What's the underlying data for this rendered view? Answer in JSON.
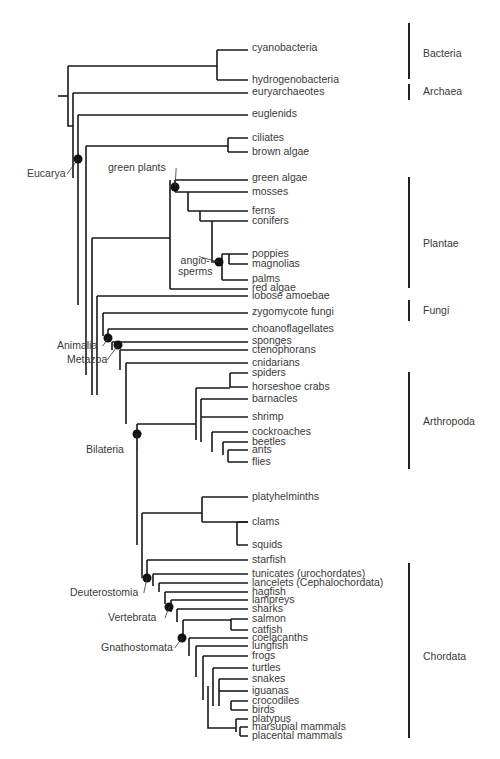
{
  "tips": [
    {
      "id": "cyanobacteria",
      "label": "cyanobacteria",
      "y": 48
    },
    {
      "id": "hydrogenobacteria",
      "label": "hydrogenobacteria",
      "y": 80
    },
    {
      "id": "euryarchaeotes",
      "label": "euryarchaeotes",
      "y": 92
    },
    {
      "id": "euglenids",
      "label": "euglenids",
      "y": 114
    },
    {
      "id": "ciliates",
      "label": "ciliates",
      "y": 138
    },
    {
      "id": "brown-algae",
      "label": "brown algae",
      "y": 152
    },
    {
      "id": "green-algae",
      "label": "green algae",
      "y": 178
    },
    {
      "id": "mosses",
      "label": "mosses",
      "y": 192
    },
    {
      "id": "ferns",
      "label": "ferns",
      "y": 211
    },
    {
      "id": "conifers",
      "label": "conifers",
      "y": 221
    },
    {
      "id": "poppies",
      "label": "poppies",
      "y": 254
    },
    {
      "id": "magnolias",
      "label": "magnolias",
      "y": 264
    },
    {
      "id": "palms",
      "label": "palms",
      "y": 279
    },
    {
      "id": "red-algae",
      "label": "red algae",
      "y": 288
    },
    {
      "id": "lobose-amoebae",
      "label": "lobose amoebae",
      "y": 296
    },
    {
      "id": "zygomycote-fungi",
      "label": "zygomycote fungi",
      "y": 312
    },
    {
      "id": "choanoflagellates",
      "label": "choanoflagellates",
      "y": 329
    },
    {
      "id": "sponges",
      "label": "sponges",
      "y": 341
    },
    {
      "id": "ctenophorans",
      "label": "ctenophorans",
      "y": 350
    },
    {
      "id": "cnidarians",
      "label": "cnidarians",
      "y": 363
    },
    {
      "id": "spiders",
      "label": "spiders",
      "y": 373
    },
    {
      "id": "horseshoe-crabs",
      "label": "horseshoe crabs",
      "y": 387
    },
    {
      "id": "barnacles",
      "label": "barnacles",
      "y": 399
    },
    {
      "id": "shrimp",
      "label": "shrimp",
      "y": 417
    },
    {
      "id": "cockroaches",
      "label": "cockroaches",
      "y": 432
    },
    {
      "id": "beetles",
      "label": "beetles",
      "y": 442
    },
    {
      "id": "ants",
      "label": "ants",
      "y": 450
    },
    {
      "id": "flies",
      "label": "flies",
      "y": 462
    },
    {
      "id": "platyhelminths",
      "label": "platyhelminths",
      "y": 497
    },
    {
      "id": "clams",
      "label": "clams",
      "y": 522
    },
    {
      "id": "squids",
      "label": "squids",
      "y": 545
    },
    {
      "id": "starfish",
      "label": "starfish",
      "y": 560
    },
    {
      "id": "tunicates",
      "label": "tunicates (urochordates)",
      "y": 574
    },
    {
      "id": "lancelets",
      "label": "lancelets (Cephalochordata)",
      "y": 583
    },
    {
      "id": "hagfish",
      "label": "hagfish",
      "y": 592
    },
    {
      "id": "lampreys",
      "label": "lampreys",
      "y": 600
    },
    {
      "id": "sharks",
      "label": "sharks",
      "y": 609
    },
    {
      "id": "salmon",
      "label": "salmon",
      "y": 619
    },
    {
      "id": "catfish",
      "label": "catfish",
      "y": 630
    },
    {
      "id": "coelacanths",
      "label": "coelacanths",
      "y": 638
    },
    {
      "id": "lungfish",
      "label": "lungfish",
      "y": 646
    },
    {
      "id": "frogs",
      "label": "frogs",
      "y": 656
    },
    {
      "id": "turtles",
      "label": "turtles",
      "y": 668
    },
    {
      "id": "snakes",
      "label": "snakes",
      "y": 679
    },
    {
      "id": "iguanas",
      "label": "iguanas",
      "y": 691
    },
    {
      "id": "crocodiles",
      "label": "crocodiles",
      "y": 701
    },
    {
      "id": "birds",
      "label": "birds",
      "y": 710
    },
    {
      "id": "platypus",
      "label": "platypus",
      "y": 719
    },
    {
      "id": "marsupial-mammals",
      "label": "marsupial mammals",
      "y": 727
    },
    {
      "id": "placental-mammals",
      "label": "placental mammals",
      "y": 736
    }
  ],
  "clades": [
    {
      "id": "eucarya",
      "label": "Eucarya",
      "node": [
        78,
        159
      ],
      "text": [
        27,
        178
      ]
    },
    {
      "id": "green-plants",
      "label": "green plants",
      "node": [
        175,
        187
      ],
      "text": [
        108,
        172
      ]
    },
    {
      "id": "angiosperms",
      "label": "angio-\nsperms",
      "node": [
        219,
        262
      ],
      "text": [
        178,
        265
      ]
    },
    {
      "id": "animalia",
      "label": "Animalia",
      "node": [
        108,
        338
      ],
      "text": [
        57,
        350
      ]
    },
    {
      "id": "metazoa",
      "label": "Metazoa",
      "node": [
        118,
        345
      ],
      "text": [
        67,
        364
      ]
    },
    {
      "id": "bilateria",
      "label": "Bilateria",
      "node": [
        137,
        434
      ],
      "text": [
        86,
        454
      ]
    },
    {
      "id": "deuterostomia",
      "label": "Deuterostomia",
      "node": [
        147,
        578
      ],
      "text": [
        70,
        597
      ]
    },
    {
      "id": "vertebrata",
      "label": "Vertebrata",
      "node": [
        169,
        607
      ],
      "text": [
        108,
        622
      ]
    },
    {
      "id": "gnathostomata",
      "label": "Gnathostomata",
      "node": [
        182,
        638
      ],
      "text": [
        101,
        652
      ]
    }
  ],
  "groups": [
    {
      "id": "bacteria",
      "label": "Bacteria",
      "y1": 23,
      "y2": 79,
      "text_y": 53
    },
    {
      "id": "archaea",
      "label": "Archaea",
      "y1": 84,
      "y2": 100,
      "text_y": 91
    },
    {
      "id": "plantae",
      "label": "Plantae",
      "y1": 177,
      "y2": 288,
      "text_y": 243
    },
    {
      "id": "fungi",
      "label": "Fungi",
      "y1": 300,
      "y2": 321,
      "text_y": 310
    },
    {
      "id": "arthropoda",
      "label": "Arthropoda",
      "y1": 372,
      "y2": 469,
      "text_y": 421
    },
    {
      "id": "chordata",
      "label": "Chordata",
      "y1": 563,
      "y2": 738,
      "text_y": 656
    }
  ],
  "branches": [
    "M58,96 H68",
    "M68,66 V126 H73",
    "M68,66 H217",
    "M217,50 V80",
    "M217,50 H248 M217,80 H248",
    "M73,93 V178 M73,93 H248",
    "M78,115 V305",
    "M78,115 H248",
    "M86,146 V375 M86,146 H228",
    "M228,138 V152 M228,138 H248 M228,152 H248",
    "M92,238 V395 M92,238 H170",
    "M170,180 V289 M170,289 H248",
    "M175,180 H248",
    "M175,180 V192 M175,192 H248",
    "M188,192 V211 M188,211 H248",
    "M200,211 V221 M200,221 H248",
    "M212,221 V262 H219",
    "M222,254 V280 M222,254 H248 M222,280 H248",
    "M229,254 V264 M229,264 H248",
    "M97,296 V395 M97,296 H248",
    "M103,313 V336 M103,313 H248",
    "M108,329 V342 M108,329 H248",
    "M112,342 V350 M112,342 H248",
    "M120,350 V370 M120,350 H248",
    "M126,363 V424 M126,363 H248",
    "M137,424 V545 M137,424 H196",
    "M196,388 V440 M196,388 H230",
    "M230,373 V387 M230,373 H248 M230,387 H248",
    "M201,399 V442 M201,399 H248",
    "M201,417 H248",
    "M212,432 V452 H212 M212,432 H248",
    "M223,442 V455 M223,442 H248",
    "M228,450 V462 M228,450 H248 M228,462 H248",
    "M142,513 V578 M142,513 H202",
    "M202,497 V522 M202,497 H248 M202,522 H248",
    "M237,522 V545 M237,522 H248 M237,545 H248",
    "M147,560 V578 M147,560 H248",
    "M153,574 V586 M153,574 H248",
    "M159,583 V592 M159,583 H248",
    "M165,592 V604 M165,592 H248",
    "M171,600 V612 M171,600 H248",
    "M177,609 V622 M177,609 H248",
    "M183,620 V637 M183,620 H231",
    "M231,619 V630 M231,619 H248 M231,630 H248",
    "M189,638 V656 M189,638 H248",
    "M196,646 V677 M196,646 H248",
    "M203,656 V700 M203,656 H248",
    "M208,686 V728 H210",
    "M213,668 V706 M213,668 H248",
    "M219,679 V706 M219,679 H248",
    "M219,691 H248",
    "M231,701 V710 M231,701 H248 M231,710 H248",
    "M210,728 H236 M236,719 V732 M236,719 H248",
    "M240,727 V736 M240,727 H248 M240,736 H248"
  ],
  "style": {
    "line_color": "#1a1a1a",
    "text_color": "#3a3a3a",
    "node_color": "#111111"
  }
}
